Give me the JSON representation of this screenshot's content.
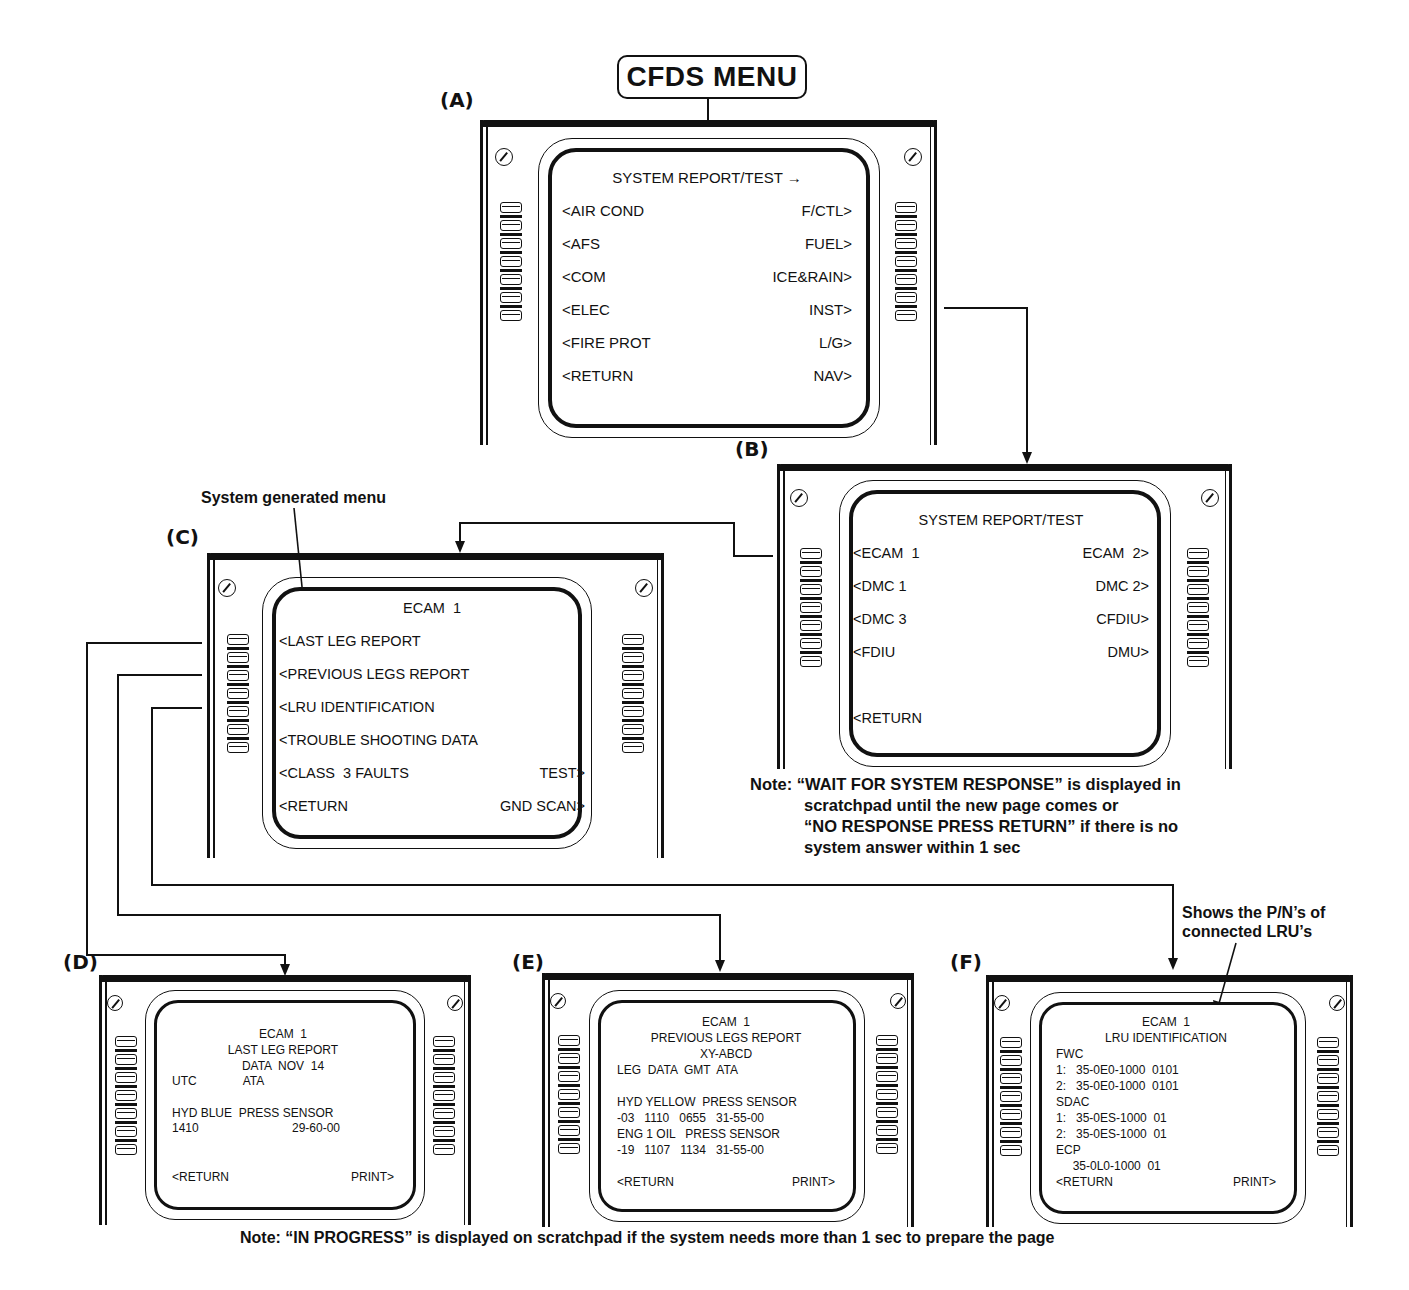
{
  "title": "CFDS MENU",
  "panels": {
    "A": {
      "label": "(A)",
      "header": "SYSTEM REPORT/TEST",
      "header_arrow": "→",
      "rows": [
        {
          "left": "<AIR COND",
          "right": "F/CTL>"
        },
        {
          "left": "<AFS",
          "right": "FUEL>"
        },
        {
          "left": "<COM",
          "right": "ICE&RAIN>"
        },
        {
          "left": "<ELEC",
          "right": "INST>"
        },
        {
          "left": "<FIRE PROT",
          "right": "L/G>"
        },
        {
          "left": "<RETURN",
          "right": "NAV>"
        }
      ]
    },
    "B": {
      "label": "(B)",
      "header": "SYSTEM REPORT/TEST",
      "rows": [
        {
          "left": "<ECAM  1",
          "right": "ECAM  2>"
        },
        {
          "left": "<DMC 1",
          "right": "DMC 2>"
        },
        {
          "left": "<DMC 3",
          "right": "CFDIU>"
        },
        {
          "left": "<FDIU",
          "right": "DMU>"
        },
        {
          "left": "",
          "right": ""
        },
        {
          "left": "<RETURN",
          "right": ""
        }
      ],
      "note_prefix": "Note:",
      "note_lines": [
        "“WAIT FOR SYSTEM RESPONSE” is displayed in",
        "scratchpad until the new page comes or",
        "“NO RESPONSE PRESS RETURN” if there is no",
        "system answer within 1 sec"
      ]
    },
    "C": {
      "label": "(C)",
      "header": "ECAM  1",
      "annotation": "System generated menu",
      "rows": [
        {
          "left": "<LAST LEG REPORT",
          "right": ""
        },
        {
          "left": "<PREVIOUS LEGS REPORT",
          "right": ""
        },
        {
          "left": "<LRU IDENTIFICATION",
          "right": ""
        },
        {
          "left": "<TROUBLE SHOOTING DATA",
          "right": ""
        },
        {
          "left": "<CLASS  3 FAULTS",
          "right": "TEST>"
        },
        {
          "left": "<RETURN",
          "right": "GND SCAN>"
        }
      ]
    },
    "D": {
      "label": "(D)",
      "lines": [
        {
          "center": "ECAM  1"
        },
        {
          "center": "LAST LEG REPORT"
        },
        {
          "center": "DATA  NOV  14"
        },
        {
          "left": "UTC              ATA"
        },
        {
          "left": ""
        },
        {
          "left": "HYD BLUE  PRESS SENSOR"
        },
        {
          "left": "1410",
          "right_at": "29-60-00"
        }
      ],
      "footer": {
        "left": "<RETURN",
        "right": "PRINT>"
      }
    },
    "E": {
      "label": "(E)",
      "lines": [
        {
          "center": "ECAM  1"
        },
        {
          "center": "PREVIOUS LEGS REPORT"
        },
        {
          "center": "XY-ABCD"
        },
        {
          "left": "LEG  DATA  GMT  ATA"
        },
        {
          "left": ""
        },
        {
          "left": "HYD YELLOW  PRESS SENSOR"
        },
        {
          "left": "-03   1110   0655   31-55-00"
        },
        {
          "left": "ENG 1 OIL   PRESS SENSOR"
        },
        {
          "left": "-19   1107   1134   31-55-00"
        }
      ],
      "footer": {
        "left": "<RETURN",
        "right": "PRINT>"
      }
    },
    "F": {
      "label": "(F)",
      "annotation_lines": [
        "Shows the P/N’s of",
        "connected LRU’s"
      ],
      "lines": [
        {
          "center": "ECAM  1"
        },
        {
          "center": "LRU IDENTIFICATION"
        },
        {
          "left": "FWC"
        },
        {
          "left": "1:   35-0E0-1000  0101"
        },
        {
          "left": "2:   35-0E0-1000  0101"
        },
        {
          "left": "SDAC"
        },
        {
          "left": "1:   35-0ES-1000  01"
        },
        {
          "left": "2:   35-0ES-1000  01"
        },
        {
          "left": "ECP"
        },
        {
          "left": "     35-0L0-1000  01"
        }
      ],
      "footer": {
        "left": "<RETURN",
        "right": "PRINT>"
      }
    }
  },
  "bottom_note": "Note: “IN PROGRESS” is displayed on scratchpad if the system needs more than 1 sec to prepare the page"
}
